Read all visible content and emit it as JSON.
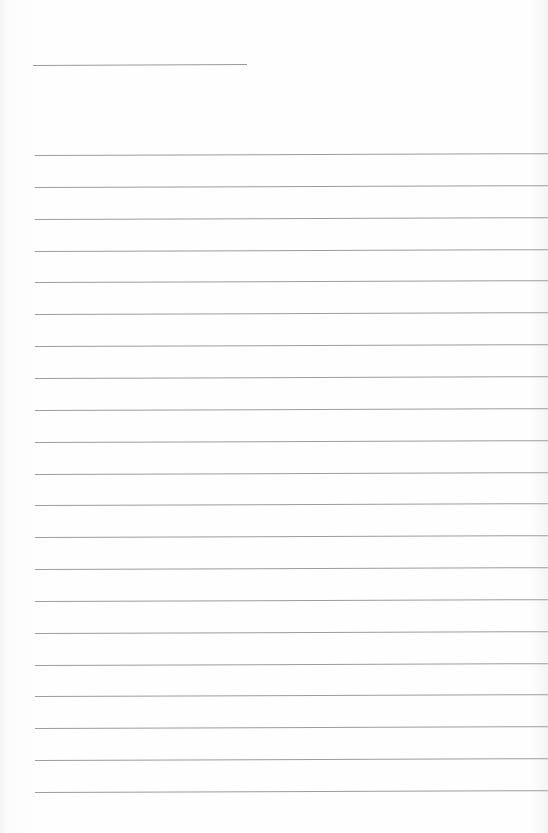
{
  "document": {
    "type": "ruled-notepaper",
    "title_line": {
      "present": true
    },
    "ruled_lines": {
      "count": 21
    },
    "colors": {
      "paper": "#fdfdfd",
      "rule": "#9c9c9c"
    }
  }
}
